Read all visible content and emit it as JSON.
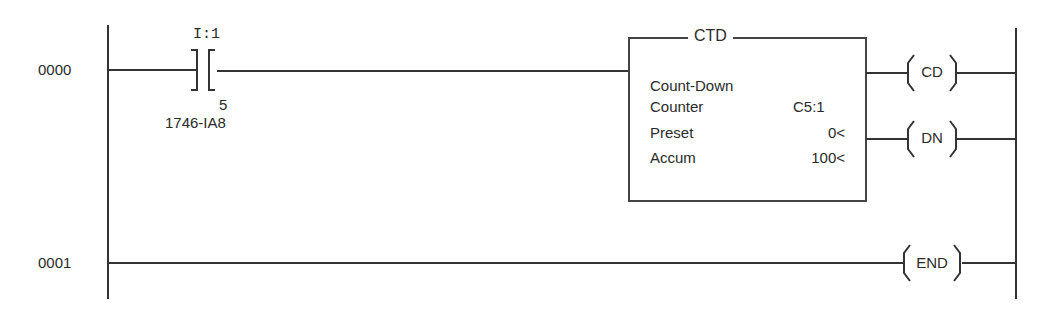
{
  "rungs": [
    {
      "number": "0000",
      "contact": {
        "address": "I:1",
        "bit": "5",
        "module": "1746-IA8"
      },
      "instruction": {
        "type": "CTD",
        "description": "Count-Down",
        "fields": [
          {
            "label": "Counter",
            "value": "C5:1"
          },
          {
            "label": "Preset",
            "value": "0<"
          },
          {
            "label": "Accum",
            "value": "100<"
          }
        ]
      },
      "outputs": [
        "CD",
        "DN"
      ]
    },
    {
      "number": "0001",
      "outputs": [
        "END"
      ]
    }
  ]
}
